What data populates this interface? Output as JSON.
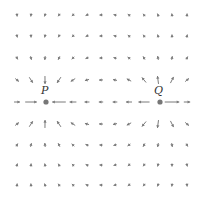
{
  "diagram": {
    "type": "vector-field",
    "arrow_color": "#7a7a7a",
    "point_color": "#777777",
    "points": [
      {
        "label": "P",
        "x": 46,
        "y": 102,
        "role": "sink",
        "label_x": 41,
        "label_y": 84
      },
      {
        "label": "Q",
        "x": 160,
        "y": 102,
        "role": "source",
        "label_x": 154,
        "label_y": 84
      }
    ],
    "grid": {
      "columns": [
        17,
        31,
        45,
        59,
        73,
        87,
        101,
        115,
        129,
        144,
        158,
        172,
        187
      ],
      "rows": [
        15,
        36,
        58,
        80,
        102,
        124,
        145,
        165,
        185
      ]
    }
  }
}
